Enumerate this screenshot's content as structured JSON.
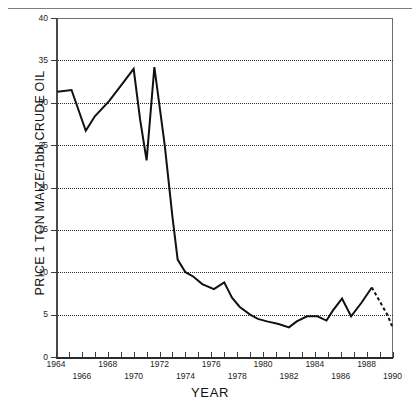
{
  "page": {
    "background_color": "#ffffff",
    "rule_color": "#7d7d7d"
  },
  "chart_data": {
    "type": "line",
    "title": "",
    "subtitle": "",
    "xlabel": "YEAR",
    "ylabel": "PRICE 1 TON MAIZE/1bbl.CRUDE OIL",
    "xlim": [
      1964,
      1990
    ],
    "ylim": [
      0,
      40
    ],
    "grid": true,
    "grid_axis": "y",
    "grid_style": "dotted",
    "legend": false,
    "legend_position": "none",
    "line_color": "#111111",
    "line_width": 2,
    "x_major_ticks": [
      1964,
      1965,
      1966,
      1967,
      1968,
      1969,
      1970,
      1971,
      1972,
      1973,
      1974,
      1975,
      1976,
      1977,
      1978,
      1979,
      1980,
      1981,
      1982,
      1983,
      1984,
      1985,
      1986,
      1987,
      1988,
      1989,
      1990
    ],
    "x_tick_labels_row_a": [
      "1964",
      "1968",
      "1972",
      "1976",
      "1980",
      "1984",
      "1988"
    ],
    "x_tick_labels_row_b": [
      "1966",
      "1970",
      "1974",
      "1978",
      "1982",
      "1986",
      "1990"
    ],
    "x_tick_labels_row_a_values": [
      1964,
      1968,
      1972,
      1976,
      1980,
      1984,
      1988
    ],
    "x_tick_labels_row_b_values": [
      1966,
      1970,
      1974,
      1978,
      1982,
      1986,
      1990
    ],
    "y_tick_labels": [
      "0",
      "5",
      "10",
      "15",
      "20",
      "25",
      "30",
      "35",
      "40"
    ],
    "y_tick_values": [
      0,
      5,
      10,
      15,
      20,
      25,
      30,
      35,
      40
    ],
    "series": [
      {
        "name": "Price 1 ton maize / 1 bbl crude oil",
        "style": "solid",
        "x": [
          1964.1,
          1965.2,
          1966.3,
          1967.0,
          1968.1,
          1969.0,
          1970.0,
          1970.5,
          1971.0,
          1971.6,
          1972.4,
          1973.0,
          1973.4,
          1974.0,
          1974.6,
          1975.3,
          1976.2,
          1977.0,
          1977.6,
          1978.2,
          1979.0,
          1979.6,
          1980.3,
          1981.2,
          1982.0,
          1982.6,
          1983.4,
          1984.2,
          1984.9,
          1985.4,
          1986.1,
          1986.8,
          1987.6,
          1988.4
        ],
        "values": [
          31.3,
          31.5,
          26.7,
          28.4,
          30.2,
          32.0,
          34.0,
          28.0,
          23.2,
          34.2,
          25.0,
          16.5,
          11.5,
          10.0,
          9.5,
          8.6,
          8.0,
          8.8,
          7.0,
          5.9,
          5.0,
          4.5,
          4.2,
          3.9,
          3.5,
          4.2,
          4.8,
          4.8,
          4.3,
          5.5,
          6.9,
          4.8,
          6.4,
          8.2
        ]
      },
      {
        "name": "Projection",
        "style": "dashed",
        "x": [
          1988.4,
          1989.0,
          1989.6,
          1990.0
        ],
        "values": [
          8.2,
          6.6,
          5.0,
          3.5
        ]
      }
    ]
  }
}
